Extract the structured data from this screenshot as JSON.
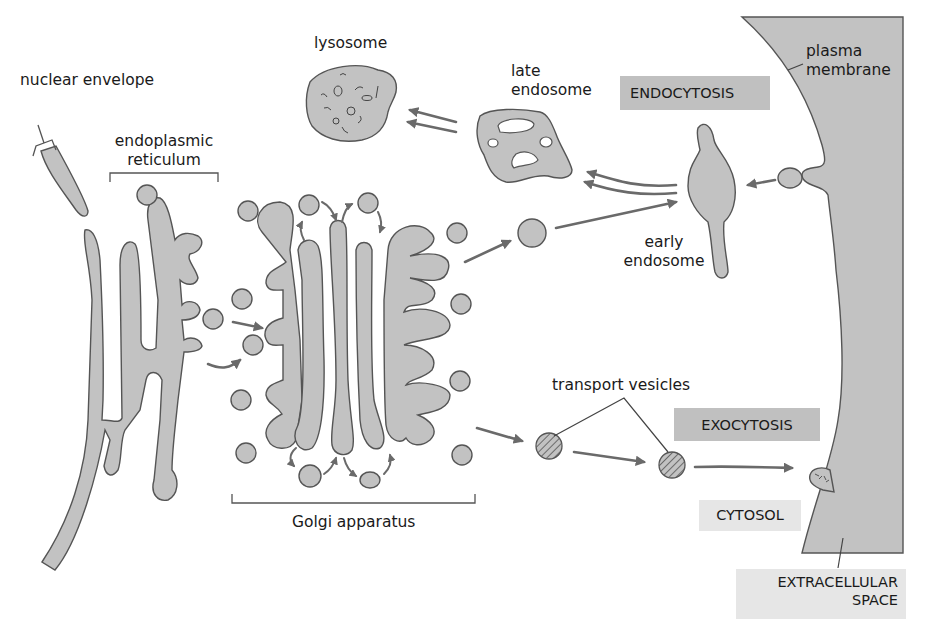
{
  "diagram": {
    "labels": {
      "nuclear_envelope": "nuclear envelope",
      "endoplasmic_reticulum_line1": "endoplasmic",
      "endoplasmic_reticulum_line2": "reticulum",
      "lysosome": "lysosome",
      "late_endosome_line1": "late",
      "late_endosome_line2": "endosome",
      "early_endosome_line1": "early",
      "early_endosome_line2": "endosome",
      "plasma_membrane_line1": "plasma",
      "plasma_membrane_line2": "membrane",
      "golgi_apparatus": "Golgi apparatus",
      "transport_vesicles": "transport vesicles"
    },
    "boxes": {
      "endocytosis": "ENDOCYTOSIS",
      "exocytosis": "EXOCYTOSIS",
      "cytosol": "CYTOSOL",
      "extracellular_line1": "EXTRACELLULAR",
      "extracellular_line2": "SPACE"
    },
    "colors": {
      "organelle_fill": "#c2c2c2",
      "outline": "#555555",
      "arrow": "#6a6a6a",
      "box_dark": "#c0c0c0",
      "box_light": "#e6e6e6"
    },
    "pathways": [
      {
        "from": "endoplasmic reticulum",
        "to": "Golgi apparatus"
      },
      {
        "from": "Golgi apparatus",
        "to": "early endosome"
      },
      {
        "from": "early endosome",
        "to": "late endosome"
      },
      {
        "from": "late endosome",
        "to": "lysosome"
      },
      {
        "from": "plasma membrane",
        "to": "early endosome",
        "process": "endocytosis"
      },
      {
        "from": "Golgi apparatus",
        "to": "transport vesicles"
      },
      {
        "from": "transport vesicles",
        "to": "plasma membrane",
        "process": "exocytosis"
      }
    ]
  }
}
